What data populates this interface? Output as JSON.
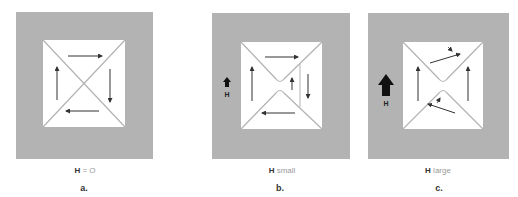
{
  "figure": {
    "colors": {
      "background": "#ffffff",
      "sample_gray": "#b3b3b3",
      "domain_white": "#ffffff",
      "wall_line": "#b3b3b3",
      "arrow": "#333333"
    },
    "panels": [
      {
        "id": "a",
        "letter": "a.",
        "caption_symbol": "H",
        "caption_rest": " = O",
        "field_label": "",
        "description": "Four closure domains, zero applied field"
      },
      {
        "id": "b",
        "letter": "b.",
        "caption_symbol": "H",
        "caption_rest": " small",
        "field_label": "H",
        "description": "Domain aligned with field grows, wall shifts right"
      },
      {
        "id": "c",
        "letter": "c.",
        "caption_symbol": "H",
        "caption_rest": " large",
        "field_label": "H",
        "description": "Magnetization rotates toward field direction"
      }
    ]
  }
}
